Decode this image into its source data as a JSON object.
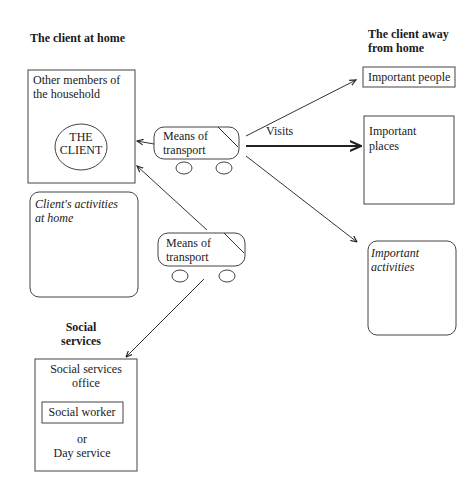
{
  "headings": {
    "home": "The client at home",
    "away_line1": "The client away",
    "away_line2": "from home",
    "social_line1": "Social",
    "social_line2": "services"
  },
  "household_box": {
    "line1": "Other members of",
    "line2": "the household",
    "client_line1": "THE",
    "client_line2": "CLIENT"
  },
  "activities_home_box": {
    "line1": "Client's activities",
    "line2": "at home"
  },
  "transport_top": {
    "line1": "Means of",
    "line2": "transport"
  },
  "transport_bottom": {
    "line1": "Means of",
    "line2": "transport"
  },
  "visits_label": "Visits",
  "important_people": "Important people",
  "important_places": {
    "line1": "Important",
    "line2": "places"
  },
  "important_activities": {
    "line1": "Important",
    "line2": "activities"
  },
  "social_services_box": {
    "line1": "Social services",
    "line2": "office",
    "worker": "Social worker",
    "or": "or",
    "day_service": "Day service"
  }
}
